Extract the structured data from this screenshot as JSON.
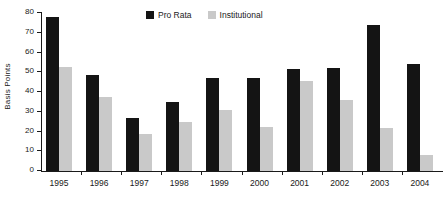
{
  "chart_data": {
    "type": "bar",
    "title": "",
    "subtitle": "",
    "xlabel": "",
    "ylabel": "Basis Points",
    "categories": [
      "1995",
      "1996",
      "1997",
      "1998",
      "1999",
      "2000",
      "2001",
      "2002",
      "2003",
      "2004"
    ],
    "series": [
      {
        "name": "Pro Rata",
        "color": "#141414",
        "values": [
          78,
          48.5,
          27,
          35,
          47,
          47,
          51.5,
          52,
          74,
          54
        ]
      },
      {
        "name": "Institutional",
        "color": "#c9c9c9",
        "values": [
          52.5,
          37.5,
          18.5,
          25,
          31,
          22.5,
          45.5,
          36,
          22,
          8
        ]
      }
    ],
    "ylim": [
      0,
      80
    ],
    "ytick_values": [
      0,
      10,
      20,
      30,
      40,
      50,
      60,
      70,
      80
    ],
    "ytick_labels": [
      "0",
      "10",
      "20",
      "30",
      "40",
      "50",
      "60",
      "70",
      "80"
    ],
    "grid": false,
    "legend_position": "top-center",
    "axis_color": "#1a1a1a",
    "background": "#ffffff"
  }
}
